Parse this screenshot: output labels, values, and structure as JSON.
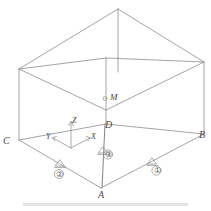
{
  "figure": {
    "type": "isometric-wireframe-box-diagram",
    "line_color": "#8d8d8d",
    "label_color": "#4a4a4a",
    "background": "#ffffff",
    "vertices": [
      {
        "name": "A",
        "label": "A",
        "x": 101,
        "y": 191,
        "role": "near-bottom-corner"
      },
      {
        "name": "B",
        "label": "B",
        "x": 199,
        "y": 134,
        "role": "right-bottom-corner"
      },
      {
        "name": "C",
        "label": "C",
        "x": 6,
        "y": 140,
        "role": "left-bottom-corner"
      },
      {
        "name": "D",
        "label": "D",
        "x": 106,
        "y": 124,
        "role": "far-bottom-corner"
      }
    ],
    "points": [
      {
        "name": "M",
        "label": "M",
        "marker": "circle",
        "x": 110,
        "y": 98
      }
    ],
    "axes": {
      "origin_label": "",
      "items": [
        {
          "name": "z-axis",
          "label": "Z",
          "direction": "up"
        },
        {
          "name": "x-axis",
          "label": "X",
          "direction": "upper-right"
        },
        {
          "name": "y-axis",
          "label": "Y",
          "direction": "upper-left"
        }
      ]
    },
    "markers": [
      {
        "name": "marker-1",
        "label": "①",
        "symbol": "support-triangle",
        "edge": "A-B"
      },
      {
        "name": "marker-2",
        "label": "②",
        "symbol": "support-triangle",
        "edge": "A-C"
      },
      {
        "name": "marker-3",
        "label": "③",
        "symbol": "support-triangle",
        "edge": "A-D"
      }
    ]
  }
}
